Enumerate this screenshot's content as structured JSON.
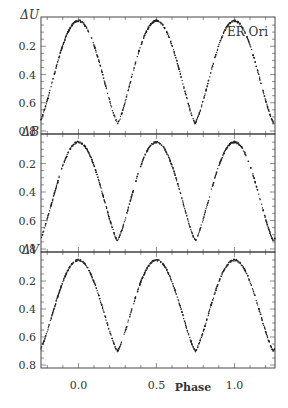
{
  "chart_data": {
    "type": "scatter",
    "title": "ER Ori",
    "xlabel": "Phase",
    "xlim": [
      -0.24,
      1.26
    ],
    "xticks": [
      "0.0",
      "0.5",
      "1.0"
    ],
    "panels": [
      {
        "ylabel": "ΔU",
        "ylim": [
          0.0,
          0.8
        ],
        "yticks": [
          "0.2",
          "0.4",
          "0.6",
          "0.8"
        ],
        "min_primary": 0.74,
        "min_secondary": 0.75,
        "max": 0.02,
        "inverted": true
      },
      {
        "ylabel": "ΔB",
        "ylim": [
          0.0,
          0.8
        ],
        "yticks": [
          "0.2",
          "0.4",
          "0.6",
          "0.8"
        ],
        "min_primary": 0.74,
        "min_secondary": 0.74,
        "max": 0.05,
        "inverted": true
      },
      {
        "ylabel": "ΔV",
        "ylim": [
          0.0,
          0.8
        ],
        "yticks": [
          "0.2",
          "0.4",
          "0.6",
          "0.8"
        ],
        "min_primary": 0.7,
        "min_secondary": 0.7,
        "max": 0.05,
        "inverted": true
      }
    ],
    "series": [
      {
        "name": "ΔU",
        "x": [
          -0.24,
          -0.15,
          -0.1,
          -0.05,
          0.0,
          0.05,
          0.1,
          0.15,
          0.25,
          0.35,
          0.4,
          0.45,
          0.5,
          0.55,
          0.6,
          0.65,
          0.75,
          0.85,
          0.9,
          0.95,
          1.0,
          1.05,
          1.1,
          1.15,
          1.25
        ],
        "values": [
          0.03,
          0.12,
          0.27,
          0.52,
          0.74,
          0.52,
          0.27,
          0.12,
          0.02,
          0.12,
          0.27,
          0.52,
          0.75,
          0.52,
          0.27,
          0.12,
          0.02,
          0.12,
          0.27,
          0.52,
          0.74,
          0.52,
          0.27,
          0.12,
          0.02
        ]
      },
      {
        "name": "ΔB",
        "x": [
          -0.24,
          -0.15,
          -0.1,
          -0.05,
          0.0,
          0.05,
          0.1,
          0.15,
          0.25,
          0.35,
          0.4,
          0.45,
          0.5,
          0.55,
          0.6,
          0.65,
          0.75,
          0.85,
          0.9,
          0.95,
          1.0,
          1.05,
          1.1,
          1.15,
          1.25
        ],
        "values": [
          0.06,
          0.14,
          0.28,
          0.52,
          0.74,
          0.52,
          0.28,
          0.14,
          0.05,
          0.14,
          0.28,
          0.52,
          0.74,
          0.52,
          0.28,
          0.14,
          0.05,
          0.14,
          0.28,
          0.52,
          0.74,
          0.52,
          0.28,
          0.14,
          0.06
        ]
      },
      {
        "name": "ΔV",
        "x": [
          -0.24,
          -0.15,
          -0.1,
          -0.05,
          0.0,
          0.05,
          0.1,
          0.15,
          0.25,
          0.35,
          0.4,
          0.45,
          0.5,
          0.55,
          0.6,
          0.65,
          0.75,
          0.85,
          0.9,
          0.95,
          1.0,
          1.05,
          1.1,
          1.15,
          1.25
        ],
        "values": [
          0.06,
          0.14,
          0.27,
          0.5,
          0.7,
          0.5,
          0.27,
          0.14,
          0.05,
          0.14,
          0.27,
          0.5,
          0.7,
          0.5,
          0.27,
          0.14,
          0.05,
          0.14,
          0.27,
          0.5,
          0.7,
          0.5,
          0.27,
          0.14,
          0.06
        ]
      }
    ],
    "grid": false,
    "legend": "none"
  },
  "labels": {
    "star": "ER Ori",
    "xlabel": "Phase",
    "panel_u": "ΔU",
    "panel_b": "ΔB",
    "panel_v": "ΔV",
    "yt_02": "0.2",
    "yt_04": "0.4",
    "yt_06": "0.6",
    "yt_08": "0.8",
    "xt_00": "0.0",
    "xt_05": "0.5",
    "xt_10": "1.0"
  }
}
